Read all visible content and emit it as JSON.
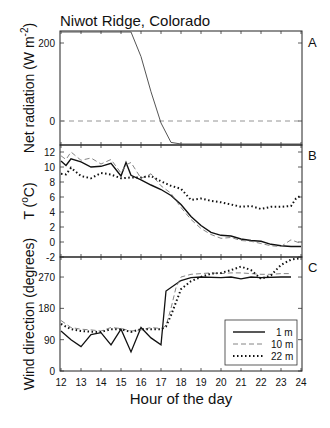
{
  "figure": {
    "title": "Niwot Ridge, Colorado",
    "xlabel": "Hour of the day",
    "x_ticks": [
      "12",
      "13",
      "14",
      "15",
      "16",
      "17",
      "18",
      "19",
      "20",
      "21",
      "22",
      "23",
      "24"
    ]
  },
  "chart_data": [
    {
      "panel": "A",
      "type": "line",
      "title": "Niwot Ridge, Colorado",
      "xlabel": "Hour of the day",
      "ylabel": "Net radiation (W m^-2)",
      "xlim": [
        12,
        24
      ],
      "ylim": [
        -180,
        700
      ],
      "y_ticks": [
        0,
        200,
        400,
        600
      ],
      "grid": false,
      "reference_line": {
        "y": 0,
        "style": "dashed"
      },
      "series": [
        {
          "name": "Net radiation",
          "style": "solid",
          "x": [
            12,
            12.5,
            13,
            13.5,
            14,
            14.5,
            15,
            15.5,
            16,
            16.5,
            17,
            17.5,
            18,
            18.5,
            19,
            20,
            21,
            22,
            23,
            24
          ],
          "y": [
            610,
            590,
            555,
            495,
            445,
            355,
            300,
            240,
            165,
            75,
            -5,
            -55,
            -85,
            -90,
            -90,
            -90,
            -90,
            -90,
            -90,
            -95
          ]
        }
      ]
    },
    {
      "panel": "B",
      "type": "line",
      "ylabel": "T (°C)",
      "xlim": [
        12,
        24
      ],
      "ylim": [
        -2,
        12.6
      ],
      "y_ticks": [
        -2,
        0,
        2,
        4,
        6,
        8,
        10,
        12
      ],
      "grid": false,
      "series": [
        {
          "name": "1 m",
          "style": "solid",
          "x": [
            12,
            12.25,
            12.5,
            13,
            13.5,
            14,
            14.5,
            15,
            15.25,
            15.5,
            16,
            16.5,
            17,
            17.5,
            18,
            18.5,
            19,
            19.5,
            20,
            20.5,
            21,
            21.5,
            22,
            22.5,
            23,
            23.5,
            24
          ],
          "y": [
            10.8,
            10.2,
            11.1,
            10.7,
            10.0,
            10.1,
            10.5,
            8.8,
            10.6,
            8.9,
            8.3,
            7.6,
            7.0,
            6.2,
            5.0,
            3.4,
            2.2,
            1.3,
            0.9,
            0.8,
            0.4,
            0.2,
            0.1,
            -0.3,
            -0.5,
            -0.6,
            -0.6
          ]
        },
        {
          "name": "10 m",
          "style": "dashed",
          "x": [
            12,
            12.25,
            12.5,
            13,
            13.5,
            14,
            14.5,
            15,
            15.25,
            15.5,
            16,
            16.5,
            17,
            17.5,
            18,
            18.5,
            19,
            19.5,
            20,
            20.5,
            21,
            21.5,
            22,
            22.5,
            23,
            23.5,
            24
          ],
          "y": [
            11.5,
            11.0,
            12.0,
            10.9,
            11.2,
            10.4,
            11.0,
            9.2,
            10.3,
            10.6,
            8.5,
            9.1,
            7.5,
            6.5,
            4.6,
            3.0,
            1.8,
            1.0,
            0.5,
            0.6,
            0.2,
            0.1,
            -0.2,
            -0.5,
            -0.6,
            0.3,
            -0.2
          ]
        },
        {
          "name": "22 m",
          "style": "dotted",
          "x": [
            12,
            12.25,
            12.5,
            13,
            13.5,
            14,
            14.5,
            15,
            15.5,
            16,
            16.5,
            17,
            17.5,
            18,
            18.5,
            19,
            19.5,
            20,
            20.5,
            21,
            21.5,
            22,
            22.5,
            23,
            23.5,
            23.75,
            24
          ],
          "y": [
            9.1,
            9.0,
            9.9,
            8.8,
            8.5,
            9.2,
            9.0,
            8.5,
            8.6,
            8.6,
            8.8,
            8.1,
            7.5,
            7.1,
            5.6,
            5.8,
            5.5,
            5.3,
            5.0,
            4.7,
            4.8,
            4.4,
            4.7,
            4.7,
            4.8,
            5.8,
            6.2
          ]
        }
      ]
    },
    {
      "panel": "C",
      "type": "line",
      "ylabel": "Wind direction (degrees)",
      "xlim": [
        12,
        24
      ],
      "ylim": [
        0,
        325
      ],
      "y_ticks": [
        0,
        90,
        180,
        270
      ],
      "grid": false,
      "legend": {
        "position": "lower right",
        "entries": [
          "1 m",
          "10 m",
          "22 m"
        ]
      },
      "series": [
        {
          "name": "1 m",
          "style": "solid",
          "x": [
            12,
            12.5,
            13,
            13.5,
            14,
            14.5,
            15,
            15.5,
            16,
            16.5,
            17,
            17.25,
            17.5,
            18,
            18.5,
            19,
            20,
            20.5,
            21,
            21.5,
            22,
            23,
            23.5
          ],
          "y": [
            115,
            90,
            70,
            105,
            110,
            75,
            120,
            55,
            125,
            95,
            75,
            230,
            240,
            260,
            268,
            270,
            268,
            270,
            265,
            270,
            268,
            270,
            270
          ]
        },
        {
          "name": "10 m",
          "style": "dashed",
          "x": [
            12,
            12.5,
            13,
            13.5,
            14,
            14.5,
            15,
            15.5,
            16,
            16.5,
            17,
            17.25,
            17.5,
            17.75,
            18,
            18.5,
            19,
            19.5,
            20,
            20.5,
            21,
            21.5,
            22,
            22.5,
            23,
            23.5
          ],
          "y": [
            145,
            125,
            120,
            118,
            115,
            125,
            122,
            115,
            118,
            125,
            122,
            130,
            180,
            240,
            270,
            278,
            280,
            282,
            280,
            282,
            282,
            280,
            278,
            278,
            280,
            280
          ]
        },
        {
          "name": "22 m",
          "style": "dotted",
          "x": [
            12,
            12.5,
            13,
            13.5,
            14,
            14.5,
            15,
            15.5,
            16,
            16.5,
            17,
            17.25,
            17.5,
            18,
            18.5,
            19,
            19.5,
            20,
            20.5,
            21,
            21.5,
            22,
            22.5,
            23,
            23.5,
            24
          ],
          "y": [
            135,
            120,
            115,
            113,
            112,
            120,
            120,
            112,
            120,
            120,
            120,
            128,
            160,
            235,
            258,
            270,
            280,
            282,
            290,
            300,
            290,
            265,
            275,
            305,
            320,
            330
          ]
        }
      ]
    }
  ],
  "panels": {
    "A": {
      "label": "A",
      "ylabel_main": "Net radiation (W m",
      "ylabel_sup": "-2",
      "ylabel_end": ")",
      "y_ticks": [
        "600",
        "400",
        "200",
        "0"
      ]
    },
    "B": {
      "label": "B",
      "ylabel_main": "T (",
      "ylabel_sup": "o",
      "ylabel_end": "C)",
      "y_ticks": [
        "12",
        "10",
        "8",
        "6",
        "4",
        "2",
        "0",
        "-2"
      ]
    },
    "C": {
      "label": "C",
      "ylabel": "Wind direction (degrees)",
      "y_ticks": [
        "270",
        "180",
        "90",
        "0"
      ]
    }
  },
  "legend": {
    "entries": [
      {
        "label": "1 m"
      },
      {
        "label": "10 m"
      },
      {
        "label": "22 m"
      }
    ]
  }
}
